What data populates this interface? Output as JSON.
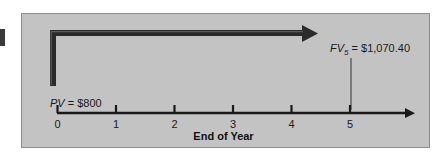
{
  "figure": {
    "kind": "timeline-diagram",
    "colors": {
      "panel_background": "#c3c3c3",
      "panel_border": "#8d8d8d",
      "page_background": "#ffffff",
      "line": "#1a1a1a",
      "text": "#1a1a1a"
    },
    "labels": {
      "future_value": {
        "symbol": "FV",
        "subscript": "5",
        "equals": "=",
        "value": "$1,070.40",
        "full_text": "FV5 = $1,070.40"
      },
      "present_value": {
        "symbol": "PV",
        "equals": "=",
        "value": "$800",
        "full_text": "PV = $800"
      },
      "axis_title": "End of Year"
    },
    "axis": {
      "ticks": [
        "0",
        "1",
        "2",
        "3",
        "4",
        "5"
      ],
      "arrow_direction": "right"
    },
    "flow_arrow": {
      "from_tick": "0",
      "to_tick": "5",
      "direction": "right",
      "description": "compounding arrow from PV at year 0 to FV at year 5"
    },
    "connector": {
      "from_label": "FV5 = $1,070.40",
      "to_tick": "5"
    }
  }
}
